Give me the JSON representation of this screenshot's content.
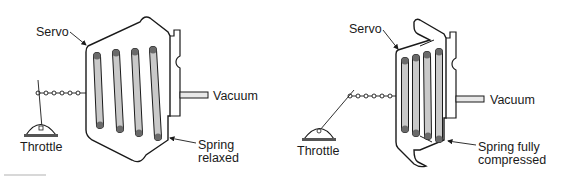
{
  "colors": {
    "outline": "#1a1a1a",
    "spring_fill": "#c9c9c9",
    "spring_end": "#6a6a6a",
    "background": "#ffffff"
  },
  "panels": [
    {
      "state": "relaxed",
      "labels": {
        "servo": "Servo",
        "vacuum": "Vacuum",
        "throttle": "Throttle",
        "spring_line1": "Spring",
        "spring_line2": "relaxed"
      }
    },
    {
      "state": "compressed",
      "labels": {
        "servo": "Servo",
        "vacuum": "Vacuum",
        "throttle": "Throttle",
        "spring_line1": "Spring fully",
        "spring_line2": "compressed"
      }
    }
  ]
}
